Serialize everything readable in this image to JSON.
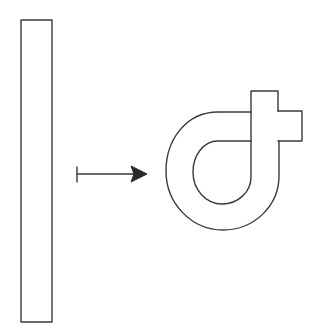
{
  "diagram": {
    "description": "Transformation of a straight bar into a looped bar with a tab",
    "stroke_color": "#3a3a3a",
    "background": "#ffffff",
    "elements": [
      {
        "id": "straight-bar",
        "shape": "tall rectangle",
        "x": 21,
        "y": 20,
        "width": 31,
        "height": 302
      },
      {
        "id": "maps-to-arrow",
        "shape": "maps-to arrow",
        "from": [
          77,
          174
        ],
        "to": [
          146,
          174
        ]
      },
      {
        "id": "looped-bar",
        "shape": "bar bent into loop with protruding tab",
        "vertical_bar": {
          "x": 251,
          "y": 91,
          "width": 27
        },
        "tab": {
          "x": 278,
          "y": 111,
          "width": 24,
          "height": 30
        }
      }
    ]
  }
}
